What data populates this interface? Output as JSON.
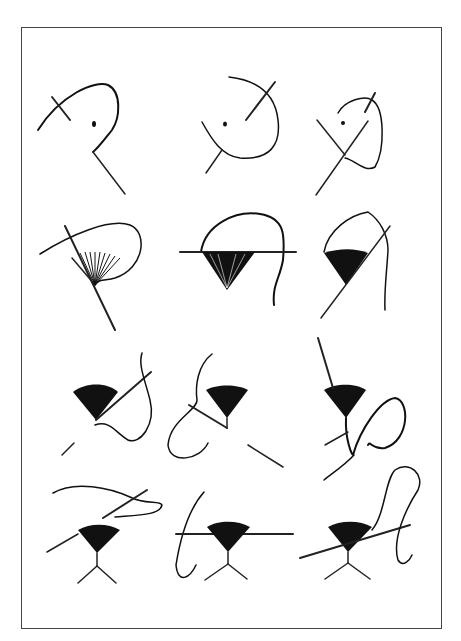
{
  "figure": {
    "title": "",
    "layout": {
      "rows": 4,
      "columns": 3
    },
    "panels": [
      {
        "row": 1,
        "col": 1,
        "step": "needle enters fabric, thread loop formed"
      },
      {
        "row": 1,
        "col": 2,
        "step": "needle emerges near center point"
      },
      {
        "row": 1,
        "col": 3,
        "step": "needle crosses thread loop"
      },
      {
        "row": 2,
        "col": 1,
        "step": "fan of straight stitches begins"
      },
      {
        "row": 2,
        "col": 2,
        "step": "completed fan, needle passed horizontally"
      },
      {
        "row": 2,
        "col": 3,
        "step": "fan with needle diagonal through edge"
      },
      {
        "row": 3,
        "col": 1,
        "step": "edge couching with needle"
      },
      {
        "row": 3,
        "col": 2,
        "step": "needle below fan, thread loop"
      },
      {
        "row": 3,
        "col": 3,
        "step": "needle from above, looping thread"
      },
      {
        "row": 4,
        "col": 1,
        "step": "stem and legs added, needle diagonal"
      },
      {
        "row": 4,
        "col": 2,
        "step": "needle horizontal through fan edge"
      },
      {
        "row": 4,
        "col": 3,
        "step": "final stitch with long thread loop"
      }
    ],
    "colors": {
      "ink": "#111111",
      "border": "#444444",
      "background": "#ffffff"
    }
  }
}
